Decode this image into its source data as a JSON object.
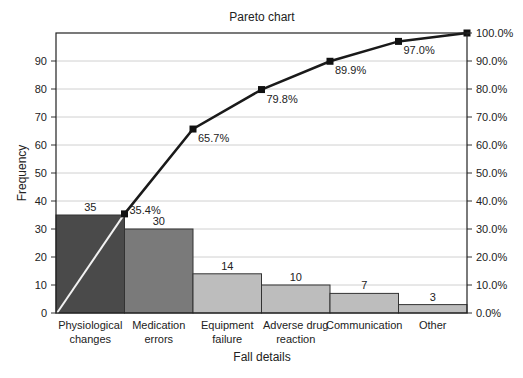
{
  "chart_data": {
    "type": "bar",
    "title": "Pareto chart",
    "xlabel": "Fall details",
    "ylabel": "Frequency",
    "y2label": "",
    "categories": [
      "Physiological changes",
      "Medication errors",
      "Equipment failure",
      "Adverse drug reaction",
      "Communication",
      "Other"
    ],
    "category_lines": [
      [
        "Physiological",
        "changes"
      ],
      [
        "Medication",
        "errors"
      ],
      [
        "Equipment",
        "failure"
      ],
      [
        "Adverse drug",
        "reaction"
      ],
      [
        "Communication"
      ],
      [
        "Other"
      ]
    ],
    "series": [
      {
        "name": "Frequency",
        "type": "bar",
        "values": [
          35,
          30,
          14,
          10,
          7,
          3
        ],
        "colors": [
          "#4a4a4a",
          "#7a7a7a",
          "#bdbdbd",
          "#bdbdbd",
          "#bdbdbd",
          "#bdbdbd"
        ]
      },
      {
        "name": "Cumulative %",
        "type": "line",
        "values": [
          35.4,
          65.7,
          79.8,
          89.9,
          97.0,
          100.0
        ],
        "labels": [
          "35.4%",
          "65.7%",
          "79.8%",
          "89.9%",
          "97.0%",
          ""
        ]
      }
    ],
    "ylim": [
      0,
      100
    ],
    "yticks": [
      0,
      10,
      20,
      30,
      40,
      50,
      60,
      70,
      80,
      90
    ],
    "y2lim": [
      0,
      100
    ],
    "y2ticks": [
      "0.0%",
      "10.0%",
      "20.0%",
      "30.0%",
      "40.0%",
      "50.0%",
      "60.0%",
      "70.0%",
      "80.0%",
      "90.0%",
      "100.0%"
    ],
    "grid": true,
    "legend": "none"
  }
}
